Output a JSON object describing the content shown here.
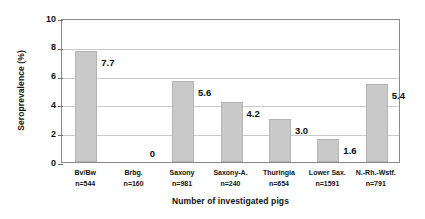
{
  "chart_data": {
    "type": "bar",
    "title": "",
    "xlabel": "Number of investigated pigs",
    "ylabel": "Seroprevalence (%)",
    "ylim": [
      0,
      10
    ],
    "ytick_labels": [
      "0",
      "2",
      "4",
      "6",
      "8",
      "10"
    ],
    "ytick_values": [
      0,
      2,
      4,
      6,
      8,
      10
    ],
    "grid": "horizontal",
    "legend": "none",
    "bar_color": "#c9c9c9",
    "categories": [
      "Bv/Bw",
      "Brbg.",
      "Saxony",
      "Saxony-A.",
      "Thuringia",
      "Lower Sax.",
      "N.-Rh.-Wstf."
    ],
    "sample_sizes": [
      "n=544",
      "n=160",
      "n=981",
      "n=240",
      "n=654",
      "n=1591",
      "n=791"
    ],
    "values": [
      7.7,
      0,
      5.6,
      4.2,
      3.0,
      1.6,
      5.4
    ],
    "value_labels": [
      "7.7",
      "0",
      "5.6",
      "4.2",
      "3.0",
      "1.6",
      "5.4"
    ]
  }
}
